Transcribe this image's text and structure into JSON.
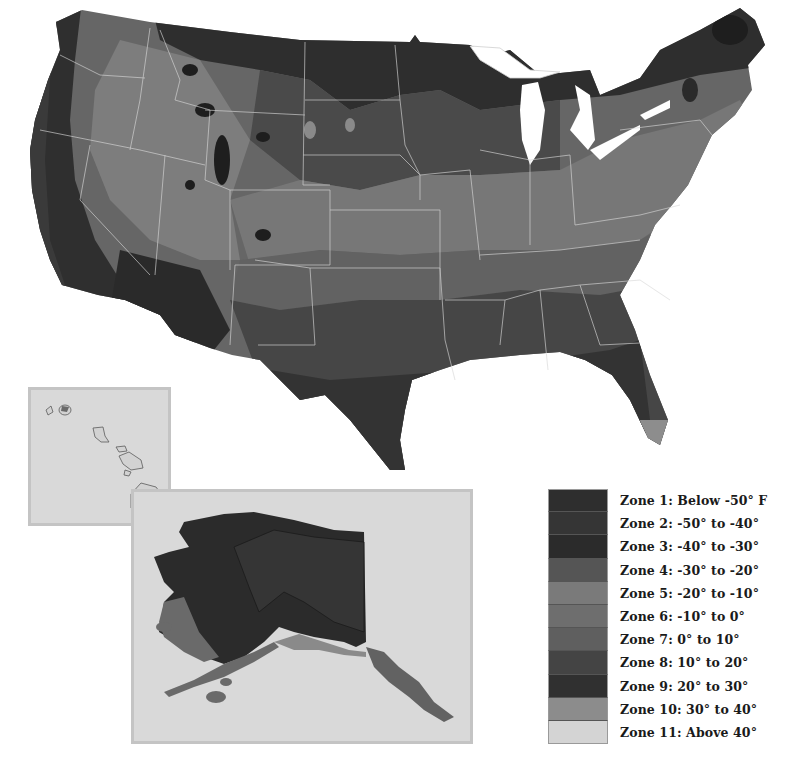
{
  "map": {
    "subject": "USDA Plant Hardiness Zone Map",
    "regions": [
      "Contiguous United States",
      "Hawaii inset",
      "Alaska inset"
    ]
  },
  "legend": {
    "items": [
      {
        "zone": 1,
        "label": "Zone 1: Below -50° F",
        "color": "#2e2e2e"
      },
      {
        "zone": 2,
        "label": "Zone 2: -50° to -40°",
        "color": "#353535"
      },
      {
        "zone": 3,
        "label": "Zone 3: -40° to -30°",
        "color": "#2b2b2b"
      },
      {
        "zone": 4,
        "label": "Zone 4: -30° to -20°",
        "color": "#555555"
      },
      {
        "zone": 5,
        "label": "Zone 5: -20° to -10°",
        "color": "#7a7a7a"
      },
      {
        "zone": 6,
        "label": "Zone 6: -10° to 0°",
        "color": "#6e6e6e"
      },
      {
        "zone": 7,
        "label": "Zone 7: 0° to 10°",
        "color": "#5f5f5f"
      },
      {
        "zone": 8,
        "label": "Zone 8: 10° to 20°",
        "color": "#444444"
      },
      {
        "zone": 9,
        "label": "Zone 9: 20° to 30°",
        "color": "#303030"
      },
      {
        "zone": 10,
        "label": "Zone 10: 30° to 40°",
        "color": "#8c8c8c"
      },
      {
        "zone": 11,
        "label": "Zone 11: Above 40°",
        "color": "#d4d4d4"
      }
    ]
  }
}
